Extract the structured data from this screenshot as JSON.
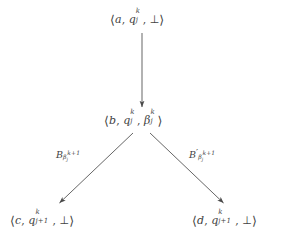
{
  "diagram": {
    "type": "tree",
    "background_color": "#ffffff",
    "ink_color": "#3f3f3f",
    "nodes": [
      {
        "id": "root",
        "data_name": "node-root",
        "text": "⟨a, q_j^k, ⊥⟩",
        "parts": {
          "open_bracket": "⟨",
          "first": "a",
          "comma1": ",",
          "state": "q",
          "state_sub": "j",
          "state_sup": "k",
          "comma2": ",",
          "last": "⊥",
          "close_bracket": "⟩"
        },
        "x": 110,
        "y": 12
      },
      {
        "id": "middle",
        "data_name": "node-middle",
        "text": "⟨b, q_j^k, β_j^k⟩",
        "parts": {
          "open_bracket": "⟨",
          "first": "b",
          "comma1": ",",
          "state": "q",
          "state_sub": "j",
          "state_sup": "k",
          "comma2": ",",
          "last": "β",
          "last_sub": "j",
          "last_sup": "k",
          "close_bracket": "⟩"
        },
        "x": 104,
        "y": 113
      },
      {
        "id": "left-leaf",
        "data_name": "node-left-leaf",
        "text": "⟨c, q_{j+1}^k, ⊥⟩",
        "parts": {
          "open_bracket": "⟨",
          "first": "c",
          "comma1": ",",
          "state": "q",
          "state_sub": "j+1",
          "state_sup": "k",
          "comma2": ",",
          "last": "⊥",
          "close_bracket": "⟩"
        },
        "x": 10,
        "y": 213
      },
      {
        "id": "right-leaf",
        "data_name": "node-right-leaf",
        "text": "⟨d, q_{j+1}^k, ⊥⟩",
        "parts": {
          "open_bracket": "⟨",
          "first": "d",
          "comma1": ",",
          "state": "q",
          "state_sub": "j+1",
          "state_sup": "k",
          "comma2": ",",
          "last": "⊥",
          "close_bracket": "⟩"
        },
        "x": 192,
        "y": 213
      }
    ],
    "edges": [
      {
        "id": "root-to-middle",
        "data_name": "edge-root-to-middle",
        "from": "root",
        "to": "middle",
        "label": "",
        "x1": 142,
        "y1": 33,
        "x2": 142,
        "y2": 108
      },
      {
        "id": "middle-to-left",
        "data_name": "edge-middle-to-left",
        "from": "middle",
        "to": "left-leaf",
        "label": "B_{β_j^{k+1}}",
        "x1": 133,
        "y1": 133,
        "x2": 58,
        "y2": 204
      },
      {
        "id": "middle-to-right",
        "data_name": "edge-middle-to-right",
        "from": "middle",
        "to": "right-leaf",
        "label": "B'_{β_j^{k+1}}",
        "x1": 150,
        "y1": 133,
        "x2": 225,
        "y2": 204
      }
    ],
    "edge_labels": [
      {
        "id": "label-left",
        "data_name": "edge-label-left",
        "base": "B",
        "prime": "",
        "sub_beta": "β",
        "sub_beta_sub": "j",
        "sub_exp": "k+1",
        "x": 56,
        "y": 148
      },
      {
        "id": "label-right",
        "data_name": "edge-label-right",
        "base": "B",
        "prime": "′",
        "sub_beta": "β",
        "sub_beta_sub": "j",
        "sub_exp": "k+1",
        "x": 189,
        "y": 148
      }
    ]
  }
}
